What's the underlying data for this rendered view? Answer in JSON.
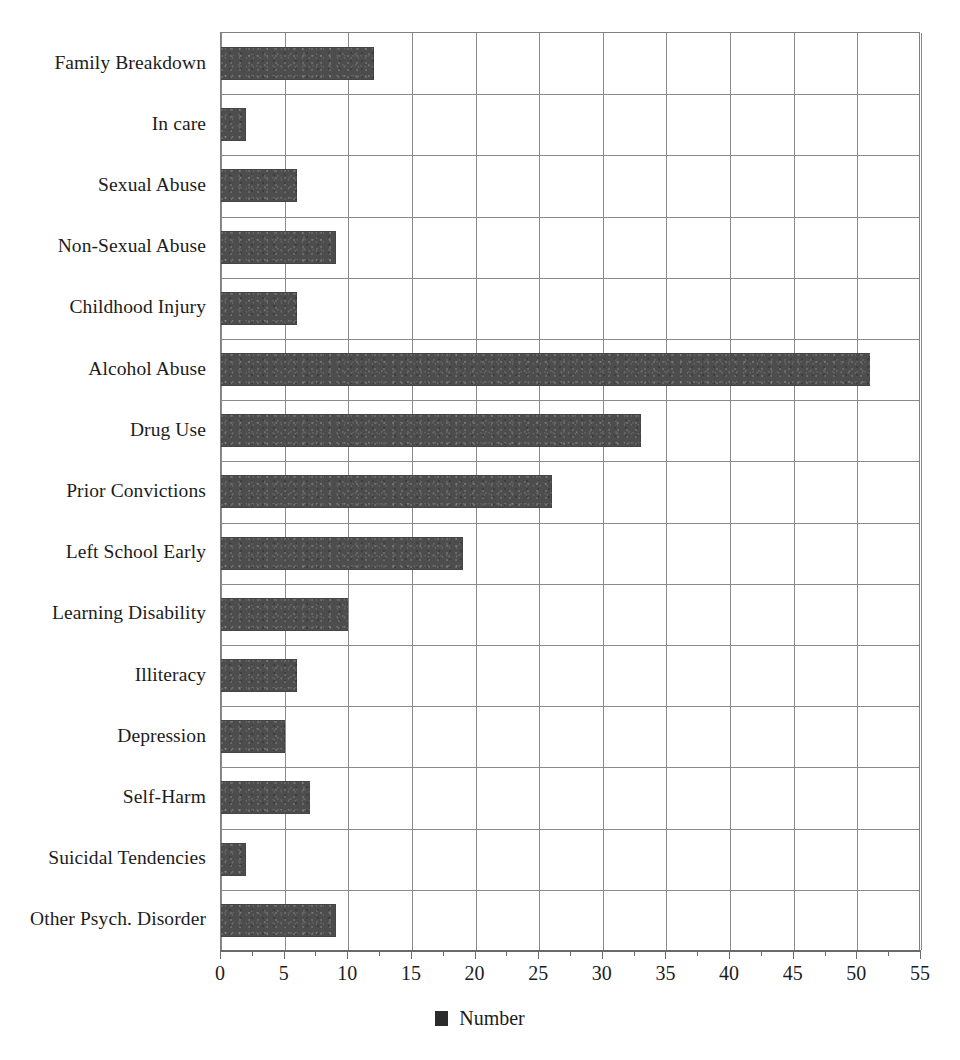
{
  "chart_data": {
    "type": "bar",
    "orientation": "horizontal",
    "title": "",
    "xlabel": "",
    "ylabel": "",
    "xlim": [
      0,
      55
    ],
    "xtick_step": 5,
    "xticks": [
      "0",
      "5",
      "10",
      "15",
      "20",
      "25",
      "30",
      "35",
      "40",
      "45",
      "50",
      "55"
    ],
    "grid": "both",
    "legend_position": "bottom-center",
    "categories": [
      "Family Breakdown",
      "In care",
      "Sexual Abuse",
      "Non-Sexual Abuse",
      "Childhood Injury",
      "Alcohol Abuse",
      "Drug Use",
      "Prior Convictions",
      "Left School Early",
      "Learning Disability",
      "Illiteracy",
      "Depression",
      "Self-Harm",
      "Suicidal Tendencies",
      "Other Psych. Disorder"
    ],
    "values": [
      12,
      2,
      6,
      9,
      6,
      51,
      33,
      26,
      19,
      10,
      6,
      5,
      7,
      2,
      9
    ],
    "series": [
      {
        "name": "Number",
        "color": "#4d4d4d",
        "values": [
          12,
          2,
          6,
          9,
          6,
          51,
          33,
          26,
          19,
          10,
          6,
          5,
          7,
          2,
          9
        ]
      }
    ]
  },
  "legend": {
    "entries": [
      {
        "label": "Number",
        "color": "#4d4d4d"
      }
    ]
  },
  "colors": {
    "bar": "#4d4d4d",
    "grid": "#8a8a8a",
    "axis": "#6a6a6a",
    "text": "#1c1c1c",
    "background": "#ffffff"
  },
  "top_caption_fragment": ""
}
